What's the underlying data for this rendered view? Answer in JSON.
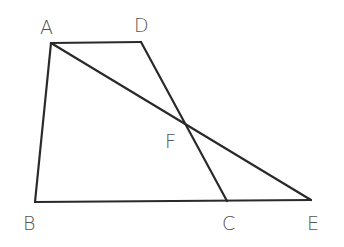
{
  "diagram": {
    "points": {
      "A": {
        "label": "A",
        "x": 51,
        "y": 43,
        "lx": 40,
        "ly": 34
      },
      "D": {
        "label": "D",
        "x": 141,
        "y": 42,
        "lx": 134,
        "ly": 32
      },
      "B": {
        "label": "B",
        "x": 35,
        "y": 202,
        "lx": 23,
        "ly": 230
      },
      "C": {
        "label": "C",
        "x": 227,
        "y": 201,
        "lx": 222,
        "ly": 230
      },
      "E": {
        "label": "E",
        "x": 311,
        "y": 200,
        "lx": 307,
        "ly": 230
      },
      "F": {
        "label": "F",
        "x": 185,
        "y": 123,
        "lx": 165,
        "ly": 148
      }
    },
    "segments": [
      [
        "A",
        "D"
      ],
      [
        "A",
        "B"
      ],
      [
        "B",
        "E"
      ],
      [
        "D",
        "C"
      ],
      [
        "A",
        "E"
      ]
    ]
  }
}
